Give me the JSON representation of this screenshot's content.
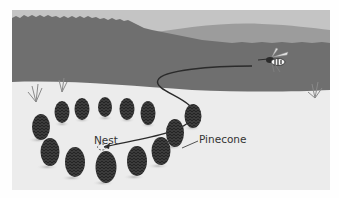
{
  "scene": {
    "description": "Illustration of a wasp flying back to its nest, which is surrounded by a ring of pinecones, in a field in front of a forest",
    "labels": {
      "nest": "Nest",
      "pinecone": "Pinecone"
    },
    "colors": {
      "sky": "#bdbdbd",
      "hill": "#9a9a9a",
      "forest": "#6e6e6e",
      "ground": "#ebebeb",
      "pinecone": "#3a3a3a",
      "flight_path": "#2b2b2b"
    },
    "objects": {
      "wasp": "wasp-icon",
      "pinecone_count": 13,
      "grass_tufts": 3
    }
  }
}
